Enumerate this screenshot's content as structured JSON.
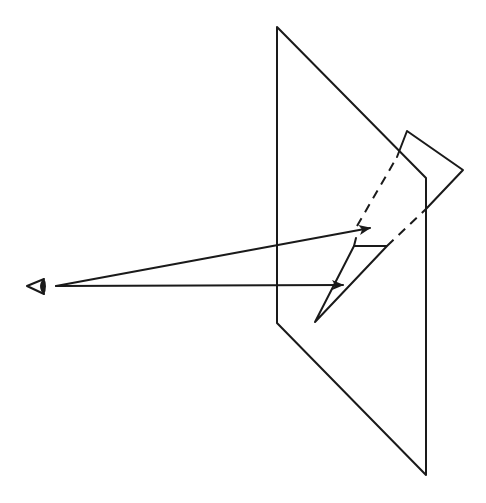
{
  "diagram": {
    "title": "Perspective projection: eye, picture plane, object and its projected image",
    "colors": {
      "stroke": "#1a1a1a",
      "background": "#ffffff"
    },
    "eye": {
      "icon": "eye-icon",
      "position": [
        40,
        286
      ]
    },
    "picture_plane": {
      "corners": [
        [
          277,
          27
        ],
        [
          426,
          178
        ],
        [
          426,
          475
        ],
        [
          277,
          323
        ]
      ]
    },
    "object_triangle": {
      "vertices": [
        [
          407,
          131
        ],
        [
          463,
          170
        ],
        [
          397,
          157
        ]
      ]
    },
    "image_triangle": {
      "vertices": [
        [
          354,
          246
        ],
        [
          387,
          246
        ],
        [
          315,
          322
        ]
      ]
    },
    "projection_rays": [
      {
        "from": [
          55,
          286
        ],
        "to": [
          370,
          228
        ],
        "style": "solid-arrow"
      },
      {
        "from": [
          55,
          286
        ],
        "to": [
          343,
          285
        ],
        "style": "solid-arrow"
      }
    ],
    "hidden_rays": [
      {
        "from": [
          357,
          226
        ],
        "to": [
          407,
          131
        ],
        "style": "dashed"
      },
      {
        "from": [
          387,
          246
        ],
        "to": [
          426,
          209
        ],
        "style": "dashed"
      }
    ]
  }
}
